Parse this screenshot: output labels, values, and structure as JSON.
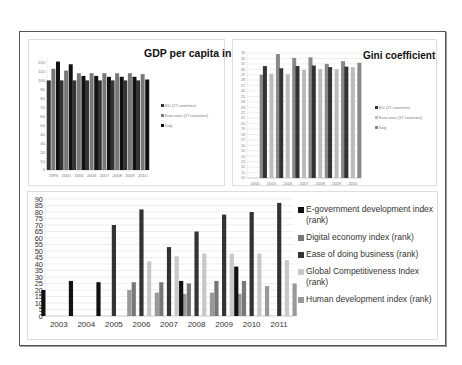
{
  "chart_data": [
    {
      "type": "bar",
      "title": "GDP per capita in PPS",
      "categories": [
        "1995",
        "2000",
        "2005",
        "2006",
        "2007",
        "2008",
        "2009",
        "2010"
      ],
      "series": [
        {
          "name": "EU (27 countries)",
          "color": "#333333",
          "values": [
            100,
            100,
            100,
            100,
            100,
            100,
            100,
            100
          ]
        },
        {
          "name": "Euro area (17 countries)",
          "color": "#777777",
          "values": [
            113,
            111,
            108,
            108,
            108,
            108,
            108,
            107
          ]
        },
        {
          "name": "Italy",
          "color": "#111111",
          "values": [
            121,
            118,
            105,
            105,
            104,
            104,
            104,
            101
          ]
        }
      ],
      "yticks": [
        0,
        10,
        20,
        30,
        40,
        50,
        60,
        70,
        80,
        90,
        100,
        110,
        120
      ],
      "ylim": [
        0,
        125
      ],
      "xlabel": "",
      "ylabel": "",
      "grid": false,
      "legend_position": "right"
    },
    {
      "type": "bar",
      "title": "Gini coefficient",
      "categories": [
        "2000",
        "2005",
        "2006",
        "2007",
        "2008",
        "2009",
        "2010"
      ],
      "series": [
        {
          "name": "EU (27 countries)",
          "color": "#333333",
          "values": [
            null,
            30.6,
            30.2,
            30.6,
            30.7,
            30.4,
            30.5
          ]
        },
        {
          "name": "Euro area (17 countries)",
          "color": "#bbbbbb",
          "values": [
            null,
            29.2,
            29.1,
            29.9,
            30.0,
            30.0,
            30.4
          ]
        },
        {
          "name": "Italy",
          "color": "#888888",
          "values": [
            29,
            32.8,
            32.1,
            32.2,
            31.0,
            31.5,
            31.2
          ]
        }
      ],
      "yticks": [
        10,
        11,
        12,
        13,
        14,
        15,
        16,
        17,
        18,
        19,
        20,
        21,
        22,
        23,
        24,
        25,
        26,
        27,
        28,
        29,
        30,
        31,
        32,
        33
      ],
      "ylim": [
        10,
        33
      ],
      "xlabel": "",
      "ylabel": "",
      "grid": true,
      "legend_position": "right"
    },
    {
      "type": "bar",
      "title": "",
      "categories": [
        "2003",
        "2004",
        "2005",
        "2006",
        "2007",
        "2008",
        "2009",
        "2010",
        "2011"
      ],
      "series": [
        {
          "name": "E-government development index (rank)",
          "color": "#111111",
          "values": [
            20,
            27,
            26,
            null,
            null,
            27,
            null,
            38,
            null
          ]
        },
        {
          "name": "Digital economy index (rank)",
          "color": "#777777",
          "values": [
            null,
            null,
            null,
            26,
            26,
            25,
            27,
            27,
            null
          ]
        },
        {
          "name": "Ease of doing business (rank)",
          "color": "#333333",
          "values": [
            null,
            null,
            70,
            82,
            53,
            65,
            78,
            80,
            87
          ]
        },
        {
          "name": "Global Competitiveness Index (rank)",
          "color": "#c8c8c8",
          "values": [
            null,
            null,
            null,
            42,
            46,
            48,
            48,
            48,
            43
          ]
        },
        {
          "name": "Human development index (rank)",
          "color": "#999999",
          "values": [
            null,
            null,
            20,
            18,
            17,
            18,
            17,
            23,
            25
          ]
        }
      ],
      "yticks": [
        0,
        5,
        10,
        15,
        20,
        25,
        30,
        35,
        40,
        45,
        50,
        55,
        60,
        65,
        70,
        75,
        80,
        85,
        90
      ],
      "ylim": [
        0,
        90
      ],
      "xlabel": "",
      "ylabel": "",
      "grid": true,
      "legend_position": "right"
    }
  ],
  "legends": {
    "gdp": [
      "EU (27 countries)",
      "Euro area (17 countries)",
      "Italy"
    ],
    "gini": [
      "EU (27 countries)",
      "Euro area (17 countries)",
      "Italy"
    ],
    "ranks": [
      "E-government development index (rank)",
      "Digital economy index (rank)",
      "Ease of doing business (rank)",
      "Global Competitiveness Index (rank)",
      "Human development index (rank)"
    ]
  }
}
